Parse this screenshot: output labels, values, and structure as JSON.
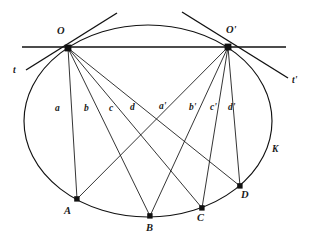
{
  "figure": {
    "name": "conic-chord-pencil-diagram",
    "caption_label": "K",
    "stroke_color": "#111111",
    "background_color": "#ffffff",
    "conic": {
      "label": "K",
      "label_x": 272,
      "label_y": 145,
      "cx": 148,
      "cy": 121,
      "rx": 124,
      "ry": 96
    },
    "points": [
      {
        "id": "O",
        "label": "O",
        "x": 68,
        "y": 48,
        "label_x": 57,
        "label_y": 26
      },
      {
        "id": "Op",
        "label": "O'",
        "x": 228,
        "y": 47,
        "label_x": 226,
        "label_y": 25
      },
      {
        "id": "A",
        "label": "A",
        "x": 77,
        "y": 199,
        "label_x": 64,
        "label_y": 206
      },
      {
        "id": "B",
        "label": "B",
        "x": 150,
        "y": 216,
        "label_x": 146,
        "label_y": 223
      },
      {
        "id": "C",
        "label": "C",
        "x": 202,
        "y": 208,
        "label_x": 197,
        "label_y": 213
      },
      {
        "id": "D",
        "label": "D",
        "x": 240,
        "y": 186,
        "label_x": 241,
        "label_y": 190
      }
    ],
    "secant": {
      "name": "line-through-O-and-O-prime",
      "x1": 22,
      "y1": 47,
      "x2": 286,
      "y2": 47
    },
    "tangents": [
      {
        "id": "t",
        "label": "t",
        "x1": 117,
        "y1": 13,
        "x2": 26,
        "y2": 70,
        "label_x": 13,
        "label_y": 66
      },
      {
        "id": "tp",
        "label": "t'",
        "x1": 182,
        "y1": 12,
        "x2": 288,
        "y2": 78,
        "label_x": 292,
        "label_y": 76
      }
    ],
    "chords": [
      {
        "id": "a",
        "label": "a",
        "from": "O",
        "to": "A",
        "label_x": 55,
        "label_y": 104
      },
      {
        "id": "b",
        "label": "b",
        "from": "O",
        "to": "B",
        "label_x": 84,
        "label_y": 104
      },
      {
        "id": "c",
        "label": "c",
        "from": "O",
        "to": "C",
        "label_x": 109,
        "label_y": 104
      },
      {
        "id": "d",
        "label": "d",
        "from": "O",
        "to": "D",
        "label_x": 130,
        "label_y": 103
      },
      {
        "id": "ap",
        "label": "a'",
        "from": "Op",
        "to": "A",
        "label_x": 159,
        "label_y": 102
      },
      {
        "id": "bp",
        "label": "b'",
        "from": "Op",
        "to": "B",
        "label_x": 189,
        "label_y": 103
      },
      {
        "id": "cp",
        "label": "c'",
        "from": "Op",
        "to": "C",
        "label_x": 210,
        "label_y": 103
      },
      {
        "id": "dp",
        "label": "d'",
        "from": "Op",
        "to": "D",
        "label_x": 228,
        "label_y": 103
      }
    ]
  }
}
